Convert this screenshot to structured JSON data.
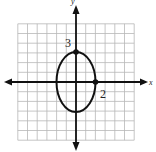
{
  "figure": {
    "problem_number": "19.",
    "axis_labels": {
      "x": "x",
      "y": "y"
    },
    "annotations": [
      {
        "text": "3",
        "near": "y-intercept (0,3)"
      },
      {
        "text": "2",
        "near": "x-intercept (2,0)"
      }
    ],
    "grid": {
      "xmin": -6,
      "xmax": 6,
      "ymin": -6,
      "ymax": 6,
      "step": 1
    },
    "curve": {
      "type": "ellipse",
      "center": [
        0,
        0
      ],
      "a_x": 2,
      "b_y": 3
    },
    "points": [
      [
        0,
        3
      ],
      [
        2,
        0
      ]
    ],
    "colors": {
      "grid": "#b8b8b8",
      "curve": "#111111",
      "axis": "#111111"
    }
  }
}
